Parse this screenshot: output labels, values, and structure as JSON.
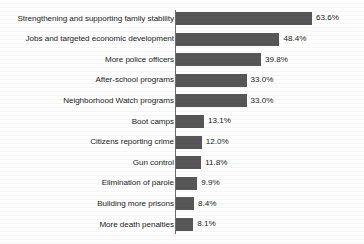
{
  "chart_data": {
    "type": "bar",
    "orientation": "horizontal",
    "title": "",
    "xlabel": "",
    "ylabel": "",
    "xlim": [
      0,
      63.6
    ],
    "grid": false,
    "legend": null,
    "value_suffix": "%",
    "bar_color": "#575757",
    "axis_color": "#6e6e6e",
    "background": "#ffffff",
    "categories": [
      "Strengthening and supporting family stability",
      "Jobs and targeted economic development",
      "More police officers",
      "After-school programs",
      "Neighborhood Watch programs",
      "Boot camps",
      "Citizens reporting crime",
      "Gun control",
      "Elimination of parole",
      "Building more prisons",
      "More death penalties"
    ],
    "values": [
      63.6,
      48.4,
      39.8,
      33.0,
      33.0,
      13.1,
      12.0,
      11.8,
      9.9,
      8.4,
      8.1
    ],
    "value_labels": [
      "63.6%",
      "48.4%",
      "39.8%",
      "33.0%",
      "33.0%",
      "13.1%",
      "12.0%",
      "11.8%",
      "9.9%",
      "8.4%",
      "8.1%"
    ]
  }
}
